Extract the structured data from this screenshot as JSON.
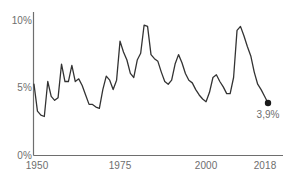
{
  "chart_data": {
    "type": "line",
    "title": "",
    "subtitle": "",
    "xlabel": "",
    "ylabel": "",
    "xlim": [
      1950,
      2018
    ],
    "ylim": [
      0,
      10
    ],
    "grid": false,
    "legend": null,
    "axis": {
      "y_ticks": [
        0,
        5,
        10
      ],
      "y_ticklabels": [
        "0%",
        "5%",
        "10%"
      ],
      "x_ticks": [
        1950,
        1975,
        2000,
        2018
      ],
      "x_ticklabels": [
        "1950",
        "1975",
        "2000",
        "2018"
      ]
    },
    "series": [
      {
        "name": "Unemployment rate",
        "color": "#333333",
        "x": [
          1950,
          1951,
          1952,
          1953,
          1954,
          1955,
          1956,
          1957,
          1958,
          1959,
          1960,
          1961,
          1962,
          1963,
          1964,
          1965,
          1966,
          1967,
          1968,
          1969,
          1970,
          1971,
          1972,
          1973,
          1974,
          1975,
          1976,
          1977,
          1978,
          1979,
          1980,
          1981,
          1982,
          1983,
          1984,
          1985,
          1986,
          1987,
          1988,
          1989,
          1990,
          1991,
          1992,
          1993,
          1994,
          1995,
          1996,
          1997,
          1998,
          1999,
          2000,
          2001,
          2002,
          2003,
          2004,
          2005,
          2006,
          2007,
          2008,
          2009,
          2010,
          2011,
          2012,
          2013,
          2014,
          2015,
          2016,
          2017,
          2018
        ],
        "values": [
          5.3,
          3.3,
          3.0,
          2.9,
          5.5,
          4.4,
          4.1,
          4.3,
          6.8,
          5.5,
          5.5,
          6.7,
          5.5,
          5.7,
          5.2,
          4.5,
          3.8,
          3.8,
          3.6,
          3.5,
          4.9,
          5.9,
          5.6,
          4.9,
          5.6,
          8.5,
          7.7,
          7.1,
          6.1,
          5.8,
          7.1,
          7.6,
          9.7,
          9.6,
          7.5,
          7.2,
          7.0,
          6.2,
          5.5,
          5.3,
          5.6,
          6.8,
          7.5,
          6.9,
          6.1,
          5.6,
          5.4,
          4.9,
          4.5,
          4.2,
          4.0,
          4.7,
          5.8,
          6.0,
          5.5,
          5.1,
          4.6,
          4.6,
          5.8,
          9.3,
          9.6,
          8.9,
          8.1,
          7.4,
          6.2,
          5.3,
          4.9,
          4.4,
          3.9
        ]
      }
    ],
    "endpoint": {
      "year": 2018,
      "value": 3.9,
      "label": "3,9%",
      "marker": "circle",
      "color": "#1a1a1a"
    }
  },
  "style": {
    "line_color": "#333333",
    "axis_color": "#6e6e6e",
    "text_color": "#6e6e6e",
    "background": "#ffffff"
  },
  "icons": {
    "endpoint_marker": "filled-circle-marker"
  }
}
